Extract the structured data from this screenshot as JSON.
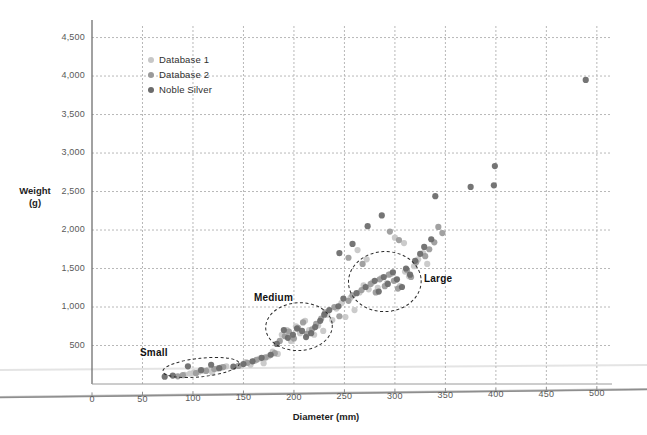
{
  "chart_data": {
    "type": "scatter",
    "title": "",
    "xlabel": "Diameter (mm)",
    "ylabel": "Weight\n(g)",
    "xlim": [
      0,
      515
    ],
    "ylim": [
      0,
      4650
    ],
    "xticks": [
      "0",
      "50",
      "100",
      "150",
      "200",
      "250",
      "300",
      "350",
      "400",
      "450",
      "500"
    ],
    "xtick_values": [
      0,
      50,
      100,
      150,
      200,
      250,
      300,
      350,
      400,
      450,
      500
    ],
    "yticks": [
      "500",
      "1,000",
      "1,500",
      "2,000",
      "2,500",
      "3,000",
      "3,500",
      "4,000",
      "4,500"
    ],
    "ytick_values": [
      500,
      1000,
      1500,
      2000,
      2500,
      3000,
      3500,
      4000,
      4500
    ],
    "grid": true,
    "grid_style": "dotted",
    "legend_position": "upper-left-inside",
    "series": [
      {
        "name": "Database 1",
        "color": "#c7c7c7",
        "points": [
          [
            92,
            120
          ],
          [
            97,
            135
          ],
          [
            101,
            150
          ],
          [
            106,
            160
          ],
          [
            110,
            175
          ],
          [
            115,
            185
          ],
          [
            119,
            150
          ],
          [
            124,
            200
          ],
          [
            128,
            215
          ],
          [
            133,
            230
          ],
          [
            148,
            240
          ],
          [
            152,
            285
          ],
          [
            157,
            250
          ],
          [
            161,
            300
          ],
          [
            166,
            330
          ],
          [
            170,
            270
          ],
          [
            175,
            360
          ],
          [
            179,
            420
          ],
          [
            184,
            390
          ],
          [
            188,
            640
          ],
          [
            193,
            700
          ],
          [
            197,
            560
          ],
          [
            202,
            750
          ],
          [
            206,
            660
          ],
          [
            211,
            820
          ],
          [
            215,
            700
          ],
          [
            220,
            640
          ],
          [
            224,
            760
          ],
          [
            229,
            690
          ],
          [
            233,
            900
          ],
          [
            238,
            830
          ],
          [
            242,
            980
          ],
          [
            247,
            1050
          ],
          [
            251,
            870
          ],
          [
            256,
            1120
          ],
          [
            260,
            960
          ],
          [
            265,
            1190
          ],
          [
            269,
            1280
          ],
          [
            274,
            1230
          ],
          [
            278,
            1320
          ],
          [
            283,
            1250
          ],
          [
            287,
            1380
          ],
          [
            292,
            1310
          ],
          [
            296,
            1430
          ],
          [
            301,
            1350
          ],
          [
            305,
            1270
          ],
          [
            310,
            1460
          ],
          [
            314,
            1400
          ],
          [
            319,
            1530
          ],
          [
            323,
            1620
          ],
          [
            328,
            1700
          ],
          [
            332,
            1560
          ],
          [
            263,
            1740
          ],
          [
            272,
            1620
          ],
          [
            300,
            1900
          ],
          [
            309,
            1830
          ]
        ]
      },
      {
        "name": "Database 2",
        "color": "#9a9a9a",
        "points": [
          [
            85,
            100
          ],
          [
            90,
            115
          ],
          [
            103,
            140
          ],
          [
            113,
            170
          ],
          [
            121,
            195
          ],
          [
            130,
            220
          ],
          [
            145,
            235
          ],
          [
            154,
            275
          ],
          [
            163,
            315
          ],
          [
            172,
            345
          ],
          [
            181,
            400
          ],
          [
            186,
            560
          ],
          [
            191,
            620
          ],
          [
            195,
            680
          ],
          [
            200,
            590
          ],
          [
            204,
            730
          ],
          [
            209,
            800
          ],
          [
            213,
            650
          ],
          [
            218,
            710
          ],
          [
            222,
            780
          ],
          [
            227,
            850
          ],
          [
            231,
            930
          ],
          [
            240,
            1000
          ],
          [
            245,
            880
          ],
          [
            254,
            1080
          ],
          [
            258,
            1150
          ],
          [
            267,
            1220
          ],
          [
            276,
            1300
          ],
          [
            281,
            1190
          ],
          [
            285,
            1360
          ],
          [
            290,
            1270
          ],
          [
            294,
            1420
          ],
          [
            299,
            1340
          ],
          [
            303,
            1240
          ],
          [
            312,
            1480
          ],
          [
            316,
            1390
          ],
          [
            321,
            1580
          ],
          [
            330,
            1660
          ],
          [
            334,
            1750
          ],
          [
            339,
            1840
          ],
          [
            254,
            1640
          ],
          [
            268,
            1560
          ],
          [
            295,
            1980
          ],
          [
            304,
            1870
          ],
          [
            343,
            2040
          ],
          [
            347,
            1960
          ]
        ]
      },
      {
        "name": "Noble Silver",
        "color": "#6b6b6b",
        "points": [
          [
            72,
            95
          ],
          [
            80,
            110
          ],
          [
            95,
            230
          ],
          [
            108,
            180
          ],
          [
            118,
            250
          ],
          [
            126,
            205
          ],
          [
            140,
            225
          ],
          [
            150,
            260
          ],
          [
            159,
            295
          ],
          [
            168,
            340
          ],
          [
            177,
            380
          ],
          [
            183,
            520
          ],
          [
            190,
            700
          ],
          [
            194,
            600
          ],
          [
            199,
            640
          ],
          [
            203,
            720
          ],
          [
            208,
            690
          ],
          [
            212,
            610
          ],
          [
            217,
            660
          ],
          [
            221,
            740
          ],
          [
            226,
            820
          ],
          [
            230,
            900
          ],
          [
            235,
            960
          ],
          [
            244,
            1010
          ],
          [
            249,
            1110
          ],
          [
            262,
            1180
          ],
          [
            271,
            1260
          ],
          [
            280,
            1340
          ],
          [
            284,
            1200
          ],
          [
            289,
            1390
          ],
          [
            293,
            1300
          ],
          [
            298,
            1450
          ],
          [
            302,
            1360
          ],
          [
            307,
            1260
          ],
          [
            311,
            1500
          ],
          [
            315,
            1420
          ],
          [
            320,
            1600
          ],
          [
            325,
            1690
          ],
          [
            329,
            1780
          ],
          [
            336,
            1880
          ],
          [
            245,
            1700
          ],
          [
            258,
            1820
          ],
          [
            273,
            2050
          ],
          [
            287,
            2190
          ],
          [
            340,
            2440
          ],
          [
            375,
            2560
          ],
          [
            398,
            2580
          ],
          [
            399,
            2830
          ],
          [
            489,
            3950
          ]
        ]
      }
    ],
    "annotations": [
      {
        "label": "Small",
        "cx": 108,
        "cy": 215,
        "rx": 38,
        "ry": 120,
        "rot": -6
      },
      {
        "label": "Medium",
        "cx": 205,
        "cy": 745,
        "rx": 33,
        "ry": 310,
        "rot": -3
      },
      {
        "label": "Large",
        "cx": 290,
        "cy": 1330,
        "rx": 36,
        "ry": 390,
        "rot": -2
      }
    ]
  },
  "legend": {
    "items": [
      {
        "label": "Database 1",
        "color": "#c7c7c7"
      },
      {
        "label": "Database 2",
        "color": "#9a9a9a"
      },
      {
        "label": "Noble Silver",
        "color": "#6b6b6b"
      }
    ]
  },
  "axes": {
    "x_title": "Diameter (mm)",
    "y_title": "Weight\n(g)"
  },
  "cluster_labels": {
    "small": "Small",
    "medium": "Medium",
    "large": "Large"
  }
}
